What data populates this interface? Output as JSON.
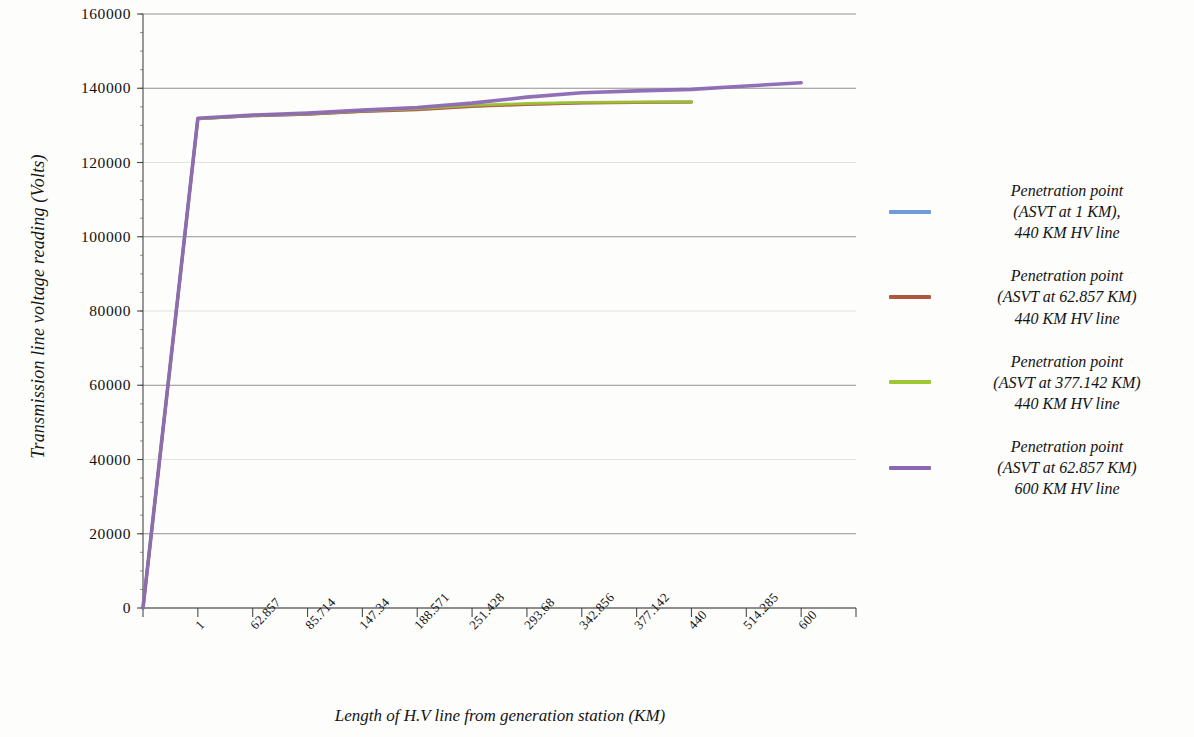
{
  "chart_data": {
    "type": "line",
    "title": "",
    "xlabel": "Length of H.V line from generation station (KM)",
    "ylabel": "Transmission line voltage reading (Volts)",
    "grid": true,
    "legend_position": "right",
    "categories": [
      "1",
      "62.857",
      "85.714",
      "147.34",
      "188.571",
      "251.428",
      "293.68",
      "342.856",
      "377.142",
      "440",
      "514.285",
      "600"
    ],
    "x_tick_labels": [
      "1",
      "62.857",
      "85.714",
      "147.34",
      "188.571",
      "251.428",
      "293.68",
      "342.856",
      "377.142",
      "440",
      "514.285",
      "600"
    ],
    "y_tick_labels": [
      "0",
      "20000",
      "40000",
      "60000",
      "80000",
      "100000",
      "120000",
      "140000",
      "160000"
    ],
    "y_ticks": [
      0,
      20000,
      40000,
      60000,
      80000,
      100000,
      120000,
      140000,
      160000
    ],
    "ylim": [
      0,
      160000
    ],
    "origin_value": 0,
    "series": [
      {
        "name": "Penetration point (ASVT at 1 KM), 440 KM HV line",
        "color": "#6f9ad8",
        "values": [
          131800,
          132600,
          133000,
          133800,
          134300,
          135200,
          135700,
          136100,
          136200,
          136300,
          null,
          null
        ]
      },
      {
        "name": "Penetration point (ASVT at 62.857 KM) 440 KM HV  line",
        "color": "#b0563d",
        "values": [
          131800,
          132600,
          133000,
          133700,
          134200,
          135100,
          135600,
          136000,
          136150,
          136250,
          null,
          null
        ]
      },
      {
        "name": "Penetration point (ASVT at 377.142 KM) 440 KM  HV line",
        "color": "#9dc733",
        "values": [
          131800,
          132700,
          133100,
          133900,
          134500,
          135400,
          135900,
          136200,
          136300,
          136350,
          null,
          null
        ]
      },
      {
        "name": "Penetration point (ASVT at 62.857 KM) 600 KM HV  line",
        "color": "#8c68b4",
        "values": [
          131900,
          132800,
          133300,
          134100,
          134800,
          136000,
          137600,
          138800,
          139300,
          139700,
          140600,
          141500
        ]
      }
    ]
  },
  "legend": {
    "items": [
      {
        "color": "#6f9ad8",
        "lines": [
          "Penetration point",
          "(ASVT at 1 KM),",
          "440 KM HV line"
        ]
      },
      {
        "color": "#b0563d",
        "lines": [
          "Penetration point",
          "(ASVT at 62.857 KM)",
          "440 KM HV  line"
        ]
      },
      {
        "color": "#9dc733",
        "lines": [
          "Penetration point",
          "(ASVT at 377.142 KM)",
          "440 KM  HV line"
        ]
      },
      {
        "color": "#8c68b4",
        "lines": [
          "Penetration point",
          "(ASVT at 62.857 KM)",
          "600 KM HV  line"
        ]
      }
    ]
  }
}
